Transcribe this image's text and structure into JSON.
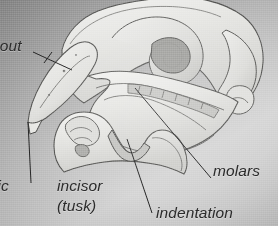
{
  "figure": {
    "background_color": "#b4b4b4",
    "ink_color": "#2b2b2b",
    "bone_fill": "#e8e8e6",
    "bone_shadow": "#bdbdbb",
    "cavity_fill": "#b3b3b1"
  },
  "labels": {
    "snout": "nout",
    "partial_left": "tic",
    "incisor": "incisor",
    "tusk": "(tusk)",
    "molars": "molars",
    "indentation": "indentation"
  },
  "leaders": [
    {
      "name": "snout-leader",
      "x1": 33,
      "y1": 52,
      "x2": 72,
      "y2": 70
    },
    {
      "name": "incisor-leader",
      "x1": 28,
      "y1": 122,
      "x2": 31,
      "y2": 183
    },
    {
      "name": "molars-leader",
      "x1": 135,
      "y1": 88,
      "x2": 211,
      "y2": 178
    },
    {
      "name": "indentation-leader",
      "x1": 127,
      "y1": 139,
      "x2": 152,
      "y2": 213
    }
  ]
}
